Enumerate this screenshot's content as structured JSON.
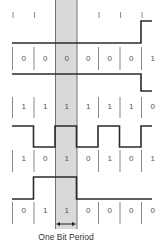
{
  "colors": {
    "waveform": "#2b2b2b",
    "separator": "#6b6b6b",
    "highlight": "#d9d9d9",
    "highlight_edge": "#555555",
    "text": "#555555"
  },
  "highlight_bit_index": 2,
  "caption": "One Bit Period",
  "caption_arrow": "↔",
  "top_tick_marks": [
    true,
    true,
    false,
    false,
    true,
    true,
    true
  ],
  "signals": [
    {
      "name": "signal-1",
      "bits": [
        "0",
        "0",
        "0",
        "0",
        "0",
        "0",
        "1"
      ],
      "levels": [
        0,
        0,
        0,
        0,
        0,
        0,
        1
      ]
    },
    {
      "name": "signal-2",
      "bits": [
        "1",
        "1",
        "1",
        "1",
        "1",
        "1",
        "0"
      ],
      "levels": [
        1,
        1,
        1,
        1,
        1,
        1,
        0
      ]
    },
    {
      "name": "signal-3",
      "bits": [
        "1",
        "0",
        "1",
        "0",
        "1",
        "0",
        "1"
      ],
      "levels": [
        1,
        0,
        1,
        0,
        1,
        0,
        1
      ]
    },
    {
      "name": "signal-4",
      "bits": [
        "0",
        "1",
        "1",
        "0",
        "0",
        "0",
        "0"
      ],
      "levels": [
        0,
        1,
        1,
        0,
        0,
        0,
        0
      ]
    }
  ]
}
